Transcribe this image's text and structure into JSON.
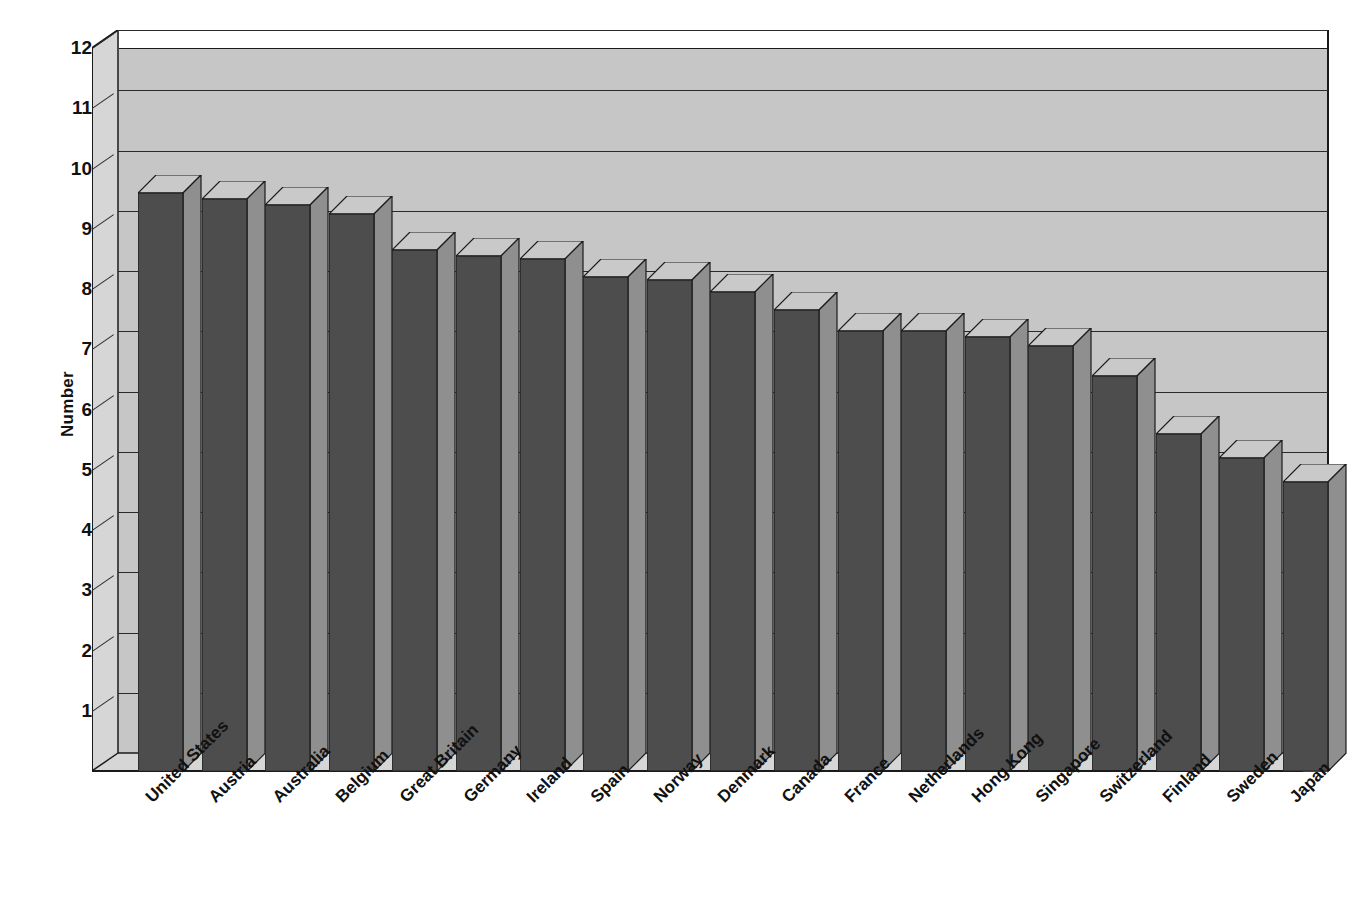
{
  "chart_data": {
    "type": "bar",
    "title": "",
    "subtitle": "",
    "xlabel": "",
    "ylabel": "Number",
    "ylim": [
      0,
      12
    ],
    "ytick_labels": [
      "12",
      "11",
      "10",
      "9",
      "8",
      "7",
      "6",
      "5",
      "4",
      "3",
      "2",
      "1"
    ],
    "yticks": [
      12,
      11,
      10,
      9,
      8,
      7,
      6,
      5,
      4,
      3,
      2,
      1
    ],
    "grid": true,
    "grid_axis": "y",
    "legend": null,
    "style": "3d-column",
    "categories": [
      "United States",
      "Austria",
      "Australia",
      "Belgium",
      "Great Britain",
      "Germany",
      "Ireland",
      "Spain",
      "Norway",
      "Denmark",
      "Canada",
      "France",
      "Netherlands",
      "Hong Kong",
      "Singapore",
      "Switzerland",
      "Finland",
      "Sweden",
      "Japan"
    ],
    "values": [
      9.6,
      9.5,
      9.4,
      9.25,
      8.65,
      8.55,
      8.5,
      8.2,
      8.15,
      7.95,
      7.65,
      7.3,
      7.3,
      7.2,
      7.05,
      6.55,
      5.6,
      5.2,
      4.8
    ],
    "series": [
      {
        "name": "Number",
        "values": [
          9.6,
          9.5,
          9.4,
          9.25,
          8.65,
          8.55,
          8.5,
          8.2,
          8.15,
          7.95,
          7.65,
          7.3,
          7.3,
          7.2,
          7.05,
          6.55,
          5.6,
          5.2,
          4.8
        ]
      }
    ],
    "annotations": []
  },
  "colors": {
    "bar_front": "#4d4d4d",
    "bar_top": "#c9c9c9",
    "bar_side": "#8f8f8f",
    "plot_background": "#c6c6c6",
    "wall_side": "#d6d6d6",
    "axis_line": "#1a1a1a",
    "gridline": "#2a2a2a",
    "text": "#111111",
    "page_background": "#ffffff"
  }
}
